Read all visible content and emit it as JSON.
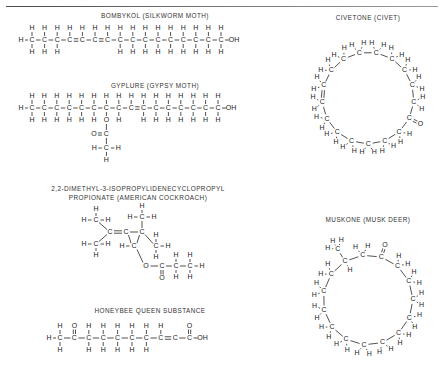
{
  "page": {
    "background_color": "#ffffff",
    "ink_color": "#333333",
    "has_top_rule": true
  },
  "atoms": {
    "carbon": "C",
    "hydrogen": "H",
    "oxygen": "O",
    "hydroxyl": "OH"
  },
  "molecules": [
    {
      "id": "bombykol",
      "caption": "BOMBYKOL (SILKWORM MOTH)",
      "source": "silkworm moth",
      "layout": "chain",
      "formula_note": "16-carbon chain terminating in OH, two C=C double bonds",
      "chain_length": 16,
      "terminal_left": "H",
      "terminal_right": "OH",
      "double_bonds": [
        "C4=C5",
        "C6=C7"
      ],
      "chain_labels": [
        "C",
        "C",
        "C",
        "C",
        "C",
        "C",
        "C",
        "C",
        "C",
        "C",
        "C",
        "C",
        "C",
        "C",
        "C",
        "C"
      ]
    },
    {
      "id": "gyplure",
      "caption": "GYPLURE (GYPSY MOTH)",
      "source": "gypsy moth",
      "layout": "chain-with-acetate-branch",
      "formula_note": "long chain ending in OH with an acetate ester branch and one C=C double bond",
      "chain_length": 16,
      "terminal_left": "H",
      "terminal_right": "OH",
      "double_bonds": [
        "C9=C10"
      ],
      "branch": {
        "attach_carbon_index": 7,
        "atoms": [
          "O",
          "C",
          "O",
          "C",
          "H",
          "H",
          "H"
        ],
        "labels": [
          "O",
          "O",
          "C",
          "H",
          "C",
          "H",
          "H"
        ]
      }
    },
    {
      "id": "cockroach",
      "caption_line1": "2,2-DIMETHYL-3-ISOPROPYLIDENECYCLOPROPYL",
      "caption_line2": "PROPIONATE (AMERICAN COCKROACH)",
      "source": "american cockroach",
      "layout": "cyclopropane-ester",
      "formula_note": "cyclopropane ring with gem-dimethyl, isopropylidene group, and propionate ester"
    },
    {
      "id": "honeybee",
      "caption": "HONEYBEE QUEEN SUBSTANCE",
      "source": "honeybee queen",
      "layout": "chain",
      "formula_note": "10-carbon chain, ketone near one end, carboxylic acid at the other, one C=C double bond",
      "chain_length": 10,
      "terminal_left": "H",
      "terminal_right": "OH",
      "ketone_carbon_index": 2,
      "double_bonds": [
        "C8=C9"
      ]
    },
    {
      "id": "civetone",
      "caption": "CIVETONE (CIVET)",
      "source": "civet",
      "layout": "macrocycle",
      "formula_note": "17-membered macrocyclic ring with one ketone C=O and one C=C double bond",
      "ring_size": 17,
      "ketone": true,
      "double_bonds": 1
    },
    {
      "id": "muskone",
      "caption": "MUSKONE (MUSK DEER)",
      "source": "musk deer",
      "layout": "macrocycle",
      "formula_note": "15-membered macrocyclic ring with a ketone C=O and a methyl branch",
      "ring_size": 15,
      "ketone": true,
      "methyl_branch": true
    }
  ]
}
